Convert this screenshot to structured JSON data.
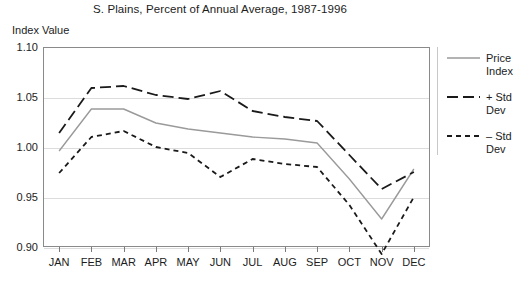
{
  "chart": {
    "title": "S. Plains, Percent of Annual Average, 1987-1996",
    "ylabel": "Index Value"
  },
  "legend": {
    "items": [
      {
        "label_line1": "Price",
        "label_line2": "Index",
        "style": "solid",
        "color": "#9a9a9a",
        "icon": "solid-line-icon"
      },
      {
        "label_line1": "+ Std",
        "label_line2": "Dev",
        "style": "long-dash",
        "color": "#1a1a1a",
        "icon": "long-dash-line-icon"
      },
      {
        "label_line1": "– Std",
        "label_line2": "Dev",
        "style": "short-dash",
        "color": "#1a1a1a",
        "icon": "short-dash-line-icon"
      }
    ]
  },
  "caption": "",
  "chart_data": {
    "type": "line",
    "title": "S. Plains, Percent of Annual Average, 1987-1996",
    "xlabel": "",
    "ylabel": "Index Value",
    "categories": [
      "JAN",
      "FEB",
      "MAR",
      "APR",
      "MAY",
      "JUN",
      "JUL",
      "AUG",
      "SEP",
      "OCT",
      "NOV",
      "DEC"
    ],
    "ylim": [
      0.9,
      1.1
    ],
    "yticks": [
      "0.90",
      "0.95",
      "1.00",
      "1.05",
      "1.10"
    ],
    "ytick_values": [
      0.9,
      0.95,
      1.0,
      1.05,
      1.1
    ],
    "grid": true,
    "legend_position": "right",
    "series": [
      {
        "name": "Price Index",
        "style": "solid",
        "color": "#9a9a9a",
        "values": [
          0.996,
          1.038,
          1.038,
          1.024,
          1.018,
          1.014,
          1.01,
          1.008,
          1.004,
          0.968,
          0.928,
          0.978
        ]
      },
      {
        "name": "+ Std Dev",
        "style": "long-dash",
        "color": "#1a1a1a",
        "values": [
          1.014,
          1.059,
          1.061,
          1.052,
          1.048,
          1.056,
          1.036,
          1.03,
          1.026,
          0.992,
          0.958,
          0.975
        ]
      },
      {
        "name": "– Std Dev",
        "style": "short-dash",
        "color": "#1a1a1a",
        "values": [
          0.974,
          1.01,
          1.016,
          1.0,
          0.994,
          0.97,
          0.988,
          0.983,
          0.98,
          0.942,
          0.893,
          0.95
        ]
      }
    ]
  }
}
